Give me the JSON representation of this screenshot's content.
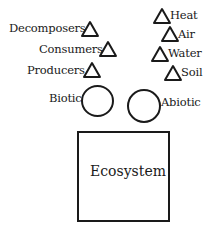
{
  "diagram": {
    "biotic_components": [
      "Decomposers",
      "Consumers",
      "Producers"
    ],
    "abiotic_components": [
      "Heat",
      "Air",
      "Water",
      "Soil"
    ],
    "categories": {
      "biotic": "Biotic",
      "abiotic": "Abiotic"
    },
    "container": "Ecosystem",
    "shapes": {
      "component": "triangle",
      "category": "circle",
      "container": "rectangle"
    },
    "stroke_color": "#1a1a1a",
    "background": "#ffffff"
  }
}
